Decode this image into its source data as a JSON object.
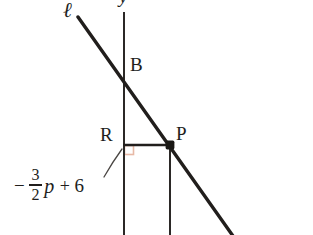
{
  "figure": {
    "type": "geometry-diagram",
    "background_color": "#ffffff",
    "stroke_color": "#211e1c",
    "right_angle_color": "#e7b9a6",
    "labels": {
      "line_l": "ℓ",
      "y_axis": "y",
      "point_b": "B",
      "point_r": "R",
      "point_p": "P"
    },
    "expression": {
      "minus": "−",
      "numerator": "3",
      "denominator": "2",
      "variable": "p",
      "operator": "+",
      "constant": "6",
      "full_text": "-3/2 p + 6"
    },
    "geometry": {
      "y_axis": {
        "x": 124,
        "y_top": 12,
        "y_bottom": 235
      },
      "line_l": {
        "x1": 78,
        "y1": 17,
        "x2": 232,
        "y2": 235
      },
      "segment_rp": {
        "x1": 124,
        "y1": 145,
        "x2": 170,
        "y2": 145
      },
      "vertical_through_p": {
        "x": 170,
        "y_top": 145,
        "y_bottom": 235
      },
      "point_b": {
        "x": 124,
        "y": 74
      },
      "point_p": {
        "x": 170,
        "y": 145
      },
      "point_r": {
        "x": 124,
        "y": 145
      },
      "right_angle_marker": {
        "x": 124,
        "y": 145,
        "size": 9
      },
      "leader_curve": {
        "from_x": 104,
        "from_y": 176,
        "to_x": 123,
        "to_y": 148
      }
    }
  }
}
